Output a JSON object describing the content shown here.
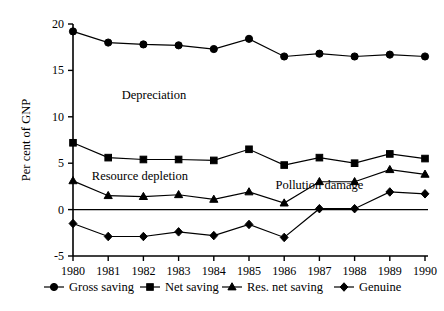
{
  "chart_data": {
    "type": "line",
    "title": "",
    "xlabel": "",
    "ylabel": "Per cent of GNP",
    "x": [
      1980,
      1981,
      1982,
      1983,
      1984,
      1985,
      1986,
      1987,
      1988,
      1989,
      1990
    ],
    "xticklabels": [
      "1980",
      "1981",
      "1982",
      "1983",
      "1984",
      "1985",
      "1986",
      "1987",
      "1988",
      "1989",
      "1990"
    ],
    "yticklabels": [
      "-5",
      "0",
      "5",
      "10",
      "15",
      "20"
    ],
    "yticks": [
      -5,
      0,
      5,
      10,
      15,
      20
    ],
    "ylim": [
      -5,
      20
    ],
    "xlim": [
      1980,
      1990
    ],
    "grid": false,
    "zero_line": true,
    "legend_position": "below-axis",
    "series": [
      {
        "name": "Gross saving",
        "marker": "circle",
        "values": [
          19.2,
          18.0,
          17.8,
          17.7,
          17.3,
          18.4,
          16.5,
          16.8,
          16.5,
          16.7,
          16.5
        ]
      },
      {
        "name": "Net saving",
        "marker": "square",
        "values": [
          7.2,
          5.6,
          5.4,
          5.4,
          5.3,
          6.5,
          4.8,
          5.6,
          5.0,
          6.0,
          5.5
        ]
      },
      {
        "name": "Res. net saving",
        "marker": "triangle",
        "values": [
          3.1,
          1.5,
          1.4,
          1.6,
          1.1,
          1.9,
          0.7,
          3.0,
          3.0,
          4.3,
          3.8
        ]
      },
      {
        "name": "Genuine",
        "marker": "diamond",
        "values": [
          -1.5,
          -2.9,
          -2.9,
          -2.4,
          -2.8,
          -1.6,
          -3.0,
          0.1,
          0.1,
          1.9,
          1.7
        ]
      }
    ],
    "annotations": [
      {
        "text": "Depreciation",
        "x": 1982.3,
        "y": 11.9
      },
      {
        "text": "Resource depletion",
        "x": 1981.9,
        "y": 3.2
      },
      {
        "text": "Pollution damage",
        "x": 1987.0,
        "y": 2.2
      }
    ]
  },
  "legend": {
    "items": [
      {
        "label": "Gross saving",
        "marker": "circle"
      },
      {
        "label": "Net saving",
        "marker": "square"
      },
      {
        "label": "Res. net saving",
        "marker": "triangle"
      },
      {
        "label": "Genuine",
        "marker": "diamond"
      }
    ]
  }
}
